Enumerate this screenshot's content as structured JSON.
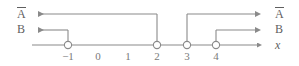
{
  "figure": {
    "type": "number-line-interval-diagram",
    "axis_variable": "x",
    "left_labels": [
      {
        "id": "a-complement-left",
        "text": "A",
        "overline": true
      },
      {
        "id": "b-left",
        "text": "B",
        "overline": false
      }
    ],
    "right_labels": [
      {
        "id": "a-complement-right",
        "text": "A",
        "overline": true
      },
      {
        "id": "b-right",
        "text": "B",
        "overline": false
      },
      {
        "id": "axis-variable-right",
        "text": "x",
        "overline": false
      }
    ],
    "ticks": [
      {
        "value": -1,
        "label": "−1",
        "x": 68,
        "open_circle": true
      },
      {
        "value": 0,
        "label": "0",
        "x": 98,
        "open_circle": false
      },
      {
        "value": 1,
        "label": "1",
        "x": 128,
        "open_circle": false
      },
      {
        "value": 2,
        "label": "2",
        "x": 157,
        "open_circle": true
      },
      {
        "value": 3,
        "label": "3",
        "x": 187,
        "open_circle": true
      },
      {
        "value": 4,
        "label": "4",
        "x": 216,
        "open_circle": true
      }
    ],
    "rays": [
      {
        "id": "a-complement-left-ray",
        "row": "A-bar",
        "direction": "left",
        "from_x": 157,
        "to_x": 32,
        "y": 14,
        "endpoint": -1
      },
      {
        "id": "a-complement-right-ray",
        "row": "A-bar",
        "direction": "right",
        "from_x": 187,
        "to_x": 262,
        "y": 14,
        "endpoint": 3
      },
      {
        "id": "b-left-ray",
        "row": "B",
        "direction": "left",
        "from_x": 68,
        "to_x": 32,
        "y": 30,
        "endpoint": -1
      },
      {
        "id": "b-right-ray",
        "row": "B",
        "direction": "right",
        "from_x": 216,
        "to_x": 262,
        "y": 30,
        "endpoint": 4
      }
    ],
    "axis": {
      "start_x": 32,
      "end_x": 262,
      "y": 45
    },
    "colors": {
      "line": "#8a8a8a",
      "text": "#6f6f6f",
      "background": "#ffffff"
    }
  }
}
